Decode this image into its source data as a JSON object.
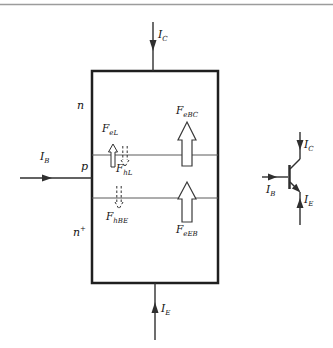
{
  "colors": {
    "line": "#2f2f2f",
    "box_border": "#1f1f1f",
    "junction_line": "#5a5a5a",
    "top_rule": "#9c9c9c",
    "text": "#141414",
    "arrow_fill": "#ffffff"
  },
  "device": {
    "region_top": {
      "main": "n",
      "sup": ""
    },
    "region_mid": {
      "main": "p",
      "sup": ""
    },
    "region_bottom": {
      "main": "n",
      "sup": "+"
    },
    "current_collector": {
      "main": "I",
      "sub": "C"
    },
    "current_base": {
      "main": "I",
      "sub": "B"
    },
    "current_emitter": {
      "main": "I",
      "sub": "E"
    },
    "flux_electron_leak": {
      "main": "F",
      "sub": "eL"
    },
    "flux_hole_leak": {
      "main": "F",
      "sub": "hL"
    },
    "flux_hole_base_emitter": {
      "main": "F",
      "sub": "hBE"
    },
    "flux_electron_base_collector": {
      "main": "F",
      "sub": "eBC"
    },
    "flux_electron_emitter_base": {
      "main": "F",
      "sub": "eEB"
    }
  },
  "symbol": {
    "current_collector": {
      "main": "I",
      "sub": "C"
    },
    "current_base": {
      "main": "I",
      "sub": "B"
    },
    "current_emitter": {
      "main": "I",
      "sub": "E"
    }
  }
}
